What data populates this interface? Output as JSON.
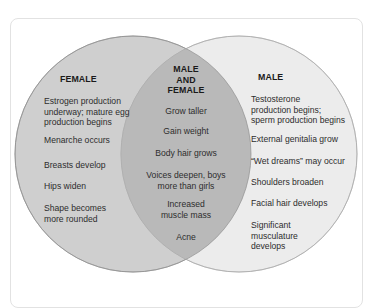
{
  "diagram": {
    "type": "venn",
    "colors": {
      "female_fill": "#cfcfcf",
      "male_fill": "#ececec",
      "overlap_fill": "#b7b7b7",
      "stroke": "#9a9a9a",
      "card_border": "#e2e2e2"
    },
    "female": {
      "title": "FEMALE",
      "items": [
        "Estrogen production underway; mature egg production begins",
        "Menarche occurs",
        "Breasts develop",
        "Hips widen",
        "Shape becomes more rounded"
      ],
      "lines": [
        [
          "Estrogen production",
          "underway; mature egg",
          "production begins"
        ],
        [
          "Menarche occurs"
        ],
        [
          "Breasts develop"
        ],
        [
          "Hips widen"
        ],
        [
          "Shape becomes",
          "more rounded"
        ]
      ]
    },
    "both": {
      "title_lines": [
        "MALE",
        "AND",
        "FEMALE"
      ],
      "items": [
        "Grow taller",
        "Gain weight",
        "Body hair grows",
        "Voices deepen, boys more than girls",
        "Increased muscle mass",
        "Acne"
      ],
      "lines": [
        [
          "Grow taller"
        ],
        [
          "Gain weight"
        ],
        [
          "Body hair grows"
        ],
        [
          "Voices deepen, boys",
          "more than girls"
        ],
        [
          "Increased",
          "muscle mass"
        ],
        [
          "Acne"
        ]
      ]
    },
    "male": {
      "title": "MALE",
      "items": [
        "Testosterone production begins; sperm production begins",
        "External genitalia grow",
        "“Wet dreams” may occur",
        "Shoulders broaden",
        "Facial hair develops",
        "Significant musculature develops"
      ],
      "lines": [
        [
          "Testosterone",
          "production begins;",
          "sperm production begins"
        ],
        [
          "External genitalia grow"
        ],
        [
          "“Wet dreams” may occur"
        ],
        [
          "Shoulders broaden"
        ],
        [
          "Facial hair develops"
        ],
        [
          "Significant",
          "musculature",
          "develops"
        ]
      ]
    }
  }
}
